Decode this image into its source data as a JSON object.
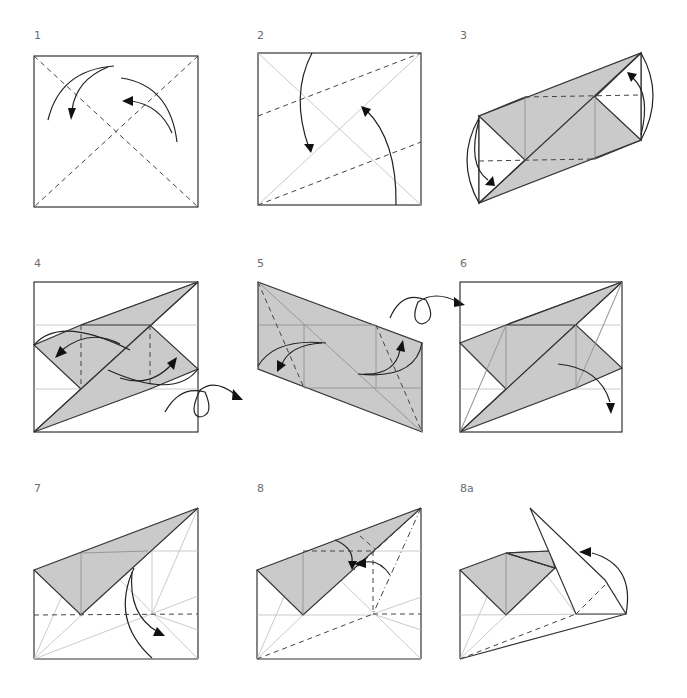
{
  "steps": [
    {
      "label": "1",
      "description": "Square with both diagonals folded as valley folds; two curved arrows"
    },
    {
      "label": "2",
      "description": "Fold two edges to the diagonal (valley folds)"
    },
    {
      "label": "3",
      "description": "Parallelogram with shaded flaps; fold ends in"
    },
    {
      "label": "4",
      "description": "Fold flaps along vertical valley lines, then turn over"
    },
    {
      "label": "5",
      "description": "Fold along dashed diagonals"
    },
    {
      "label": "6",
      "description": "Unfold flap"
    },
    {
      "label": "7",
      "description": "Fold along horizontal valley line"
    },
    {
      "label": "8",
      "description": "Fold with valley and mountain folds"
    },
    {
      "label": "8a",
      "description": "Intermediate step, flap swinging"
    }
  ],
  "colors": {
    "paper_shade": "#cacaca",
    "line": "#333333",
    "crease": "#bdbdbd",
    "label": "#6d6d6d"
  }
}
